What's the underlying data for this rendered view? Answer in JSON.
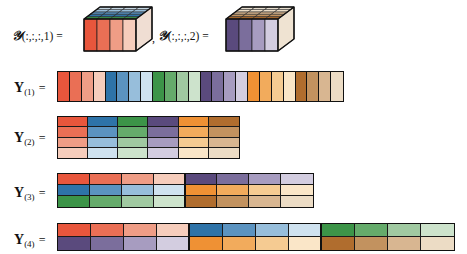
{
  "figure": {
    "type": "tensor-unfolding-diagram",
    "background": "#ffffff"
  },
  "palette": {
    "red": [
      "#e8563c",
      "#ea6f55",
      "#ef9d86",
      "#f6cdbc"
    ],
    "blue": [
      "#2e73a8",
      "#5b93c0",
      "#97bedb",
      "#cfe2ef"
    ],
    "green": [
      "#3c9448",
      "#65ab6b",
      "#a0c9a1",
      "#cde3cc"
    ],
    "purple": [
      "#5a4a7d",
      "#7b6e9c",
      "#a79cc0",
      "#d3cde0"
    ],
    "orange": [
      "#ef9134",
      "#f2ab5c",
      "#f5cb92",
      "#fae6c8"
    ],
    "brown": [
      "#b06d2e",
      "#c2925f",
      "#d8b691",
      "#ecdcc5"
    ]
  },
  "slices": [
    {
      "label_script": "𝒴",
      "label_index": "(:,:,:,1) =",
      "name": "tensor-slice-1",
      "front_face_colors": [
        "#e8563c",
        "#ea6f55",
        "#ef9d86",
        "#f6cdbc"
      ],
      "top_face_colors": [
        "#3c9448",
        "#2e73a8",
        "#5b93c0",
        "#97bedb",
        "#cfe2ef"
      ],
      "side_face_color": "#f0ded3"
    },
    {
      "label_script": "𝒴",
      "label_index": "(:,:,:,2) =",
      "name": "tensor-slice-2",
      "front_face_colors": [
        "#5a4a7d",
        "#7b6e9c",
        "#a79cc0",
        "#d3cde0"
      ],
      "top_face_colors": [
        "#b06d2e",
        "#c2925f",
        "#d8b691",
        "#ecdcc5",
        "#f4ead9"
      ],
      "side_face_color": "#efe3d2"
    }
  ],
  "separator": ",",
  "unfoldings": [
    {
      "name": "unfolding-1",
      "label_symbol": "Y",
      "label_sub": "(1)",
      "label_eq": "=",
      "rows": 1,
      "cols": 24,
      "block_cols": 4,
      "cells": [
        [
          "#e8563c",
          "#ea6f55",
          "#ef9d86",
          "#f6cdbc",
          "#2e73a8",
          "#5b93c0",
          "#97bedb",
          "#cfe2ef",
          "#3c9448",
          "#65ab6b",
          "#a0c9a1",
          "#cde3cc",
          "#5a4a7d",
          "#7b6e9c",
          "#a79cc0",
          "#d3cde0",
          "#ef9134",
          "#f2ab5c",
          "#f5cb92",
          "#fae6c8",
          "#b06d2e",
          "#c2925f",
          "#d8b691",
          "#ecdcc5"
        ]
      ]
    },
    {
      "name": "unfolding-2",
      "label_symbol": "Y",
      "label_sub": "(2)",
      "label_eq": "=",
      "rows": 4,
      "cols": 6,
      "block_cols": 1,
      "cells": [
        [
          "#e8563c",
          "#2e73a8",
          "#3c9448",
          "#5a4a7d",
          "#ef9134",
          "#b06d2e"
        ],
        [
          "#ea6f55",
          "#5b93c0",
          "#65ab6b",
          "#7b6e9c",
          "#f2ab5c",
          "#c2925f"
        ],
        [
          "#ef9d86",
          "#97bedb",
          "#a0c9a1",
          "#a79cc0",
          "#f5cb92",
          "#d8b691"
        ],
        [
          "#f6cdbc",
          "#cfe2ef",
          "#cde3cc",
          "#d3cde0",
          "#fae6c8",
          "#ecdcc5"
        ]
      ]
    },
    {
      "name": "unfolding-3",
      "label_symbol": "Y",
      "label_sub": "(3)",
      "label_eq": "=",
      "rows": 3,
      "cols": 8,
      "block_cols": 4,
      "cells": [
        [
          "#e8563c",
          "#ea6f55",
          "#ef9d86",
          "#f6cdbc",
          "#5a4a7d",
          "#7b6e9c",
          "#a79cc0",
          "#d3cde0"
        ],
        [
          "#2e73a8",
          "#5b93c0",
          "#97bedb",
          "#cfe2ef",
          "#ef9134",
          "#f2ab5c",
          "#f5cb92",
          "#fae6c8"
        ],
        [
          "#3c9448",
          "#65ab6b",
          "#a0c9a1",
          "#cde3cc",
          "#b06d2e",
          "#c2925f",
          "#d8b691",
          "#ecdcc5"
        ]
      ]
    },
    {
      "name": "unfolding-4",
      "label_symbol": "Y",
      "label_sub": "(4)",
      "label_eq": "=",
      "rows": 2,
      "cols": 12,
      "block_cols": 4,
      "cells": [
        [
          "#e8563c",
          "#ea6f55",
          "#ef9d86",
          "#f6cdbc",
          "#2e73a8",
          "#5b93c0",
          "#97bedb",
          "#cfe2ef",
          "#3c9448",
          "#65ab6b",
          "#a0c9a1",
          "#cde3cc"
        ],
        [
          "#5a4a7d",
          "#7b6e9c",
          "#a79cc0",
          "#d3cde0",
          "#ef9134",
          "#f2ab5c",
          "#f5cb92",
          "#fae6c8",
          "#b06d2e",
          "#c2925f",
          "#d8b691",
          "#ecdcc5"
        ]
      ]
    }
  ]
}
